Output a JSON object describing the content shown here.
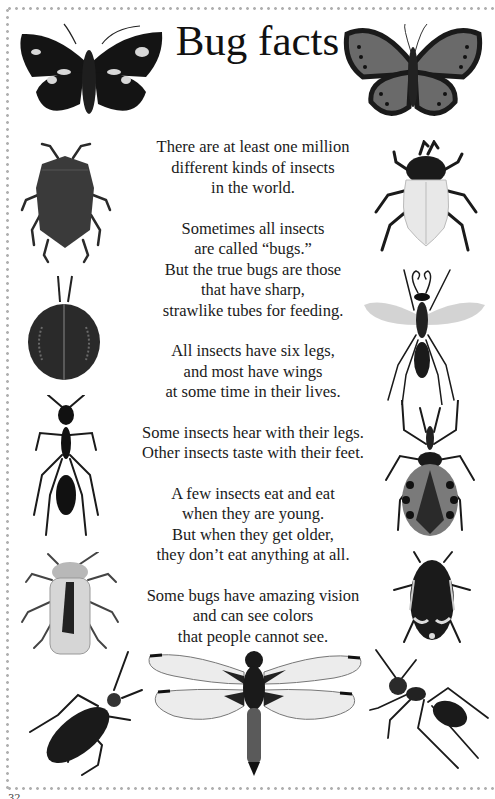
{
  "page": {
    "title": "Bug facts",
    "page_number": "32",
    "border_color": "#b0b0b0"
  },
  "facts": [
    {
      "lines": [
        "There are at least one million",
        "different kinds of insects",
        "in the world."
      ]
    },
    {
      "lines": [
        "Sometimes all insects",
        "are called “bugs.”",
        "But the true bugs are those",
        "that have sharp,",
        "strawlike tubes for feeding."
      ]
    },
    {
      "lines": [
        "All insects have six legs,",
        "and most have wings",
        "at some time in their lives."
      ]
    },
    {
      "lines": [
        "Some insects hear with their legs.",
        "Other insects taste with their feet."
      ]
    },
    {
      "lines": [
        "A few insects eat and eat",
        "when they are young.",
        "But when they get older,",
        "they don’t eat anything at all."
      ]
    },
    {
      "lines": [
        "Some bugs have amazing vision",
        "and can see colors",
        "that people cannot see."
      ]
    }
  ],
  "illustrations": [
    {
      "id": "moth-top-left",
      "label": "dark moth with white wing spots"
    },
    {
      "id": "butterfly-top-right",
      "label": "grey butterfly with dark spotted wing edges"
    },
    {
      "id": "shield-bug-left",
      "label": "shield bug"
    },
    {
      "id": "tortoise-beetle-left",
      "label": "round dark beetle with patterned shell"
    },
    {
      "id": "ant-left",
      "label": "black long-legged ant"
    },
    {
      "id": "pale-beetle-left",
      "label": "pale beetle with dark stripe"
    },
    {
      "id": "soldier-bug-left",
      "label": "dark elongated bug"
    },
    {
      "id": "white-beetle-right",
      "label": "beetle with white wing cases"
    },
    {
      "id": "wasp-right",
      "label": "winged wasp"
    },
    {
      "id": "assassin-bug-right",
      "label": "assassin bug with spotted abdomen"
    },
    {
      "id": "spotted-beetle-right",
      "label": "dark beetle with white markings"
    },
    {
      "id": "ant-right",
      "label": "walking ant"
    },
    {
      "id": "dragonfly-bottom",
      "label": "dragonfly"
    }
  ]
}
